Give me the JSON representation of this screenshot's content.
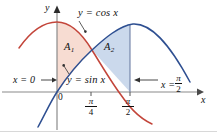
{
  "figure": {
    "type": "math-diagram",
    "caption_text": null,
    "axes": {
      "x_axis_label": "x",
      "y_axis_label": "y",
      "origin_label": "0",
      "x_ticks": [
        {
          "name": "pi-over-4",
          "numerator": "π",
          "denominator": "4",
          "x_px": 91
        },
        {
          "name": "pi-over-2",
          "numerator": "π",
          "denominator": "2",
          "x_px": 130
        }
      ]
    },
    "curves": [
      {
        "name": "cosine-curve",
        "label_prefix": "y",
        "label_equals": "=",
        "label_body": "cos x",
        "color": "#C0392B",
        "stroke": "#C3453A"
      },
      {
        "name": "sine-curve",
        "label_prefix": "y",
        "label_equals": "=",
        "label_body": "sin x",
        "color": "#2B4A8B",
        "stroke": "#2E4F91"
      }
    ],
    "labels": {
      "cos_label": "y = cos x",
      "sin_label": "y = sin x",
      "region_a1_base": "A",
      "region_a1_sub": "1",
      "region_a2_base": "A",
      "region_a2_sub": "2",
      "boundary_left": "x = 0",
      "boundary_right_prefix": "x =",
      "boundary_right_num": "π",
      "boundary_right_den": "2"
    },
    "regions": [
      {
        "name": "region-a1",
        "fill": "#F7DCD2",
        "from": "x = 0",
        "to": "x = π/4",
        "upper": "cos x",
        "lower": "sin x"
      },
      {
        "name": "region-a2",
        "fill": "#CBD9EC",
        "from": "x = π/4",
        "to": "x = π/2",
        "upper": "sin x",
        "lower": "cos x"
      }
    ],
    "colors": {
      "cos_stroke": "#C3453A",
      "sin_stroke": "#2E4F91",
      "a1_fill": "#F7DCD2",
      "a2_fill": "#CBD9EC",
      "axis": "#8A8A8A",
      "text": "#111111"
    }
  }
}
